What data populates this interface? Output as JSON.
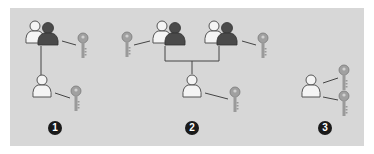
{
  "colors": {
    "background": "#ffffff",
    "panel": "#d7d7d7",
    "user_light": "#f4f4f4",
    "user_dark": "#4a4a4a",
    "outline": "#555555",
    "key": "#9a9a9a",
    "line": "#444444",
    "badge": "#1a1a1a"
  },
  "diagram": {
    "scenarios": [
      {
        "id": 1,
        "badge_label": "1",
        "nodes": [
          {
            "type": "user-group",
            "key_count": 1,
            "key_side": "right"
          },
          {
            "type": "user",
            "key_count": 1,
            "key_side": "right"
          }
        ],
        "connection": "group-to-single"
      },
      {
        "id": 2,
        "badge_label": "2",
        "nodes": [
          {
            "type": "user-group",
            "key_count": 1,
            "key_side": "left"
          },
          {
            "type": "user-group",
            "key_count": 1,
            "key_side": "right"
          },
          {
            "type": "user",
            "key_count": 1,
            "key_side": "right"
          }
        ],
        "connection": "two-groups-to-single"
      },
      {
        "id": 3,
        "badge_label": "3",
        "nodes": [
          {
            "type": "user",
            "key_count": 2,
            "key_side": "right"
          }
        ],
        "connection": "none"
      }
    ]
  }
}
